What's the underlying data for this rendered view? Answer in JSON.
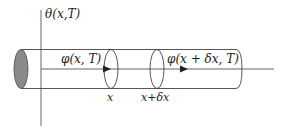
{
  "diagram": {
    "axis_label": "θ(x,T)",
    "flux_left": "φ(x, T)",
    "flux_right": "φ(x + δx, T)",
    "pos_x": "x",
    "pos_x_dx": "x+δx"
  },
  "colors": {
    "line": "#444444",
    "end_cap_fill": "#8a8a8a"
  }
}
